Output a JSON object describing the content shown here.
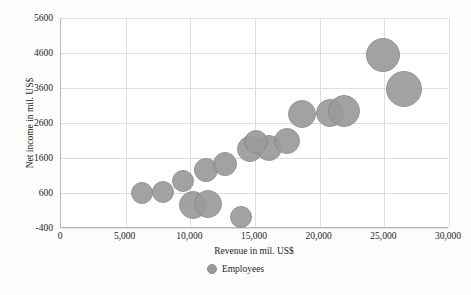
{
  "chart_data": {
    "type": "scatter",
    "title": "",
    "xlabel": "Revenue in mil. US$",
    "ylabel": "Net income in mil. US$",
    "xlim": [
      0,
      30000
    ],
    "ylim": [
      -400,
      5600
    ],
    "grid": true,
    "legend_position": "bottom",
    "legend": [
      "Employees"
    ],
    "bubble_size_series": "Employees",
    "xticks": [
      "0",
      "5,000",
      "10,000",
      "15,000",
      "20,000",
      "25,000",
      "30,000"
    ],
    "xtick_values": [
      0,
      5000,
      10000,
      15000,
      20000,
      25000,
      30000
    ],
    "yticks": [
      "5600",
      "4600",
      "3600",
      "2600",
      "1600",
      "600",
      "-400"
    ],
    "ytick_values": [
      5600,
      4600,
      3600,
      2600,
      1600,
      600,
      -400
    ],
    "points": [
      {
        "x": 6300,
        "y": 600,
        "size": 11
      },
      {
        "x": 7900,
        "y": 640,
        "size": 11
      },
      {
        "x": 9400,
        "y": 950,
        "size": 11
      },
      {
        "x": 10200,
        "y": 260,
        "size": 14
      },
      {
        "x": 11200,
        "y": 1250,
        "size": 12
      },
      {
        "x": 11400,
        "y": 290,
        "size": 14
      },
      {
        "x": 12700,
        "y": 1430,
        "size": 12
      },
      {
        "x": 13900,
        "y": -80,
        "size": 11
      },
      {
        "x": 14600,
        "y": 1850,
        "size": 13
      },
      {
        "x": 16100,
        "y": 1880,
        "size": 13
      },
      {
        "x": 15100,
        "y": 2050,
        "size": 12
      },
      {
        "x": 17500,
        "y": 2100,
        "size": 13
      },
      {
        "x": 18600,
        "y": 2860,
        "size": 14
      },
      {
        "x": 20800,
        "y": 2900,
        "size": 14
      },
      {
        "x": 21900,
        "y": 2930,
        "size": 16
      },
      {
        "x": 24900,
        "y": 4530,
        "size": 17
      },
      {
        "x": 26500,
        "y": 3580,
        "size": 18
      }
    ]
  },
  "colors": {
    "bubble_fill": "#9b9b9b",
    "bubble_stroke": "#8c8c8c",
    "gridline": "#dedede",
    "axis": "#b9b9b9",
    "text": "#1c1c1c",
    "background": "#ffffff"
  }
}
